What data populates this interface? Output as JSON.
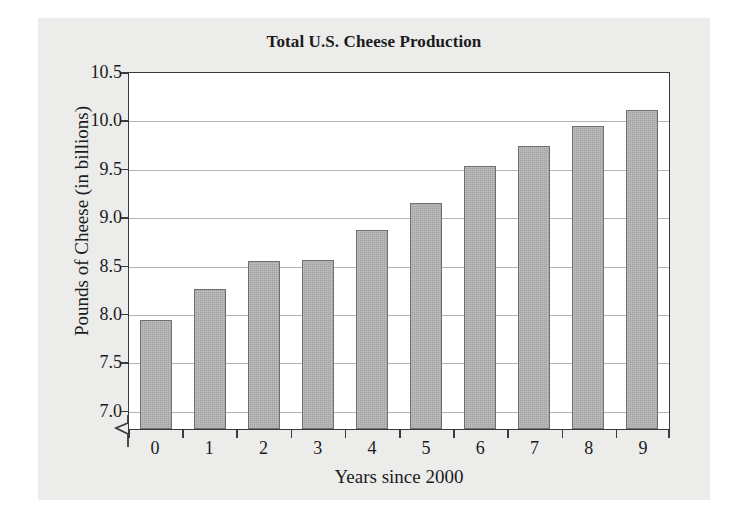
{
  "chart_data": {
    "type": "bar",
    "title": "Total U.S. Cheese Production",
    "xlabel": "Years since 2000",
    "ylabel": "Pounds of Cheese (in billions)",
    "categories": [
      "0",
      "1",
      "2",
      "3",
      "4",
      "5",
      "6",
      "7",
      "8",
      "9"
    ],
    "values": [
      7.93,
      8.25,
      8.54,
      8.55,
      8.86,
      9.14,
      9.52,
      9.72,
      9.93,
      10.1
    ],
    "ylim": [
      6.8,
      10.5
    ],
    "yticks": [
      "10.5",
      "10.0",
      "9.5",
      "9.0",
      "8.5",
      "8.0",
      "7.5",
      "7.0"
    ],
    "ytick_values": [
      10.5,
      10.0,
      9.5,
      9.0,
      8.5,
      8.0,
      7.5,
      7.0
    ],
    "grid": true,
    "legend": "none",
    "axis_break": true,
    "bar_color": "#a3a3a3",
    "bar_edge_color": "#6f6f6f",
    "grid_color": "#b4b4b4",
    "axis_color": "#3a3a3a",
    "panel_color": "#ececeb",
    "plot_background": "#ffffff",
    "text_color": "#1b1b1b"
  }
}
